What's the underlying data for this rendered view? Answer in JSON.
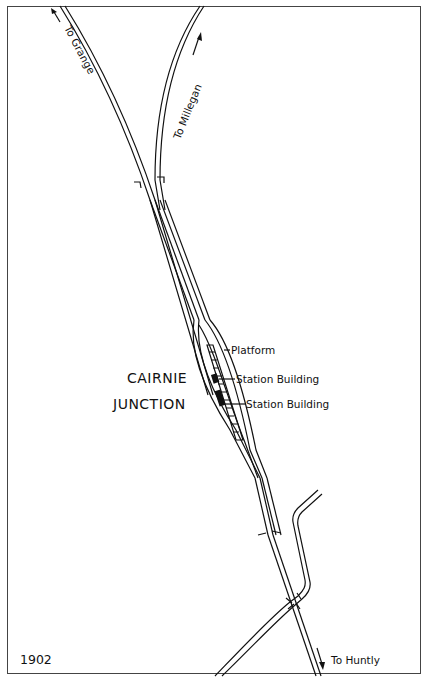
{
  "map": {
    "title_line1": "CAIRNIE",
    "title_line2": "JUNCTION",
    "year": "1902",
    "destinations": {
      "grange": "To Grange",
      "millegan": "To Millegan",
      "huntly": "To Huntly"
    },
    "features": {
      "platform": "Platform",
      "station_building_1": "Station Building",
      "station_building_2": "Station Building"
    },
    "colors": {
      "ink": "#111111",
      "paper": "#ffffff",
      "frame": "#444444"
    }
  }
}
